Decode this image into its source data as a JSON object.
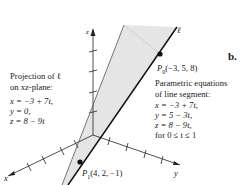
{
  "figure": {
    "panel_label": "b.",
    "line_label": "ℓ",
    "axes": {
      "x": "x",
      "y": "y",
      "z": "z"
    },
    "points": {
      "p0": {
        "label": "P",
        "sub": "0",
        "coords": "(−3, 5, 8)"
      },
      "p1": {
        "label": "P",
        "sub": "1",
        "coords": "(4, 2, −1)"
      }
    },
    "projection": {
      "title1": "Projection of ℓ",
      "title2": "on xz-plane:",
      "eq1": "x = −3 + 7t,",
      "eq2": "y = 0,",
      "eq3": "z = 8 − 9t"
    },
    "segment": {
      "title1": "Parametric equations",
      "title2": "of line segment:",
      "eq1": "x = −3 + 7t,",
      "eq2": "y = 5 − 3t,",
      "eq3": "z = 8 − 9t,",
      "eq4": "for 0 ≤ t ≤ 1"
    },
    "colors": {
      "shade": "#e6e6e6",
      "line": "#111111",
      "axis": "#222222"
    }
  }
}
